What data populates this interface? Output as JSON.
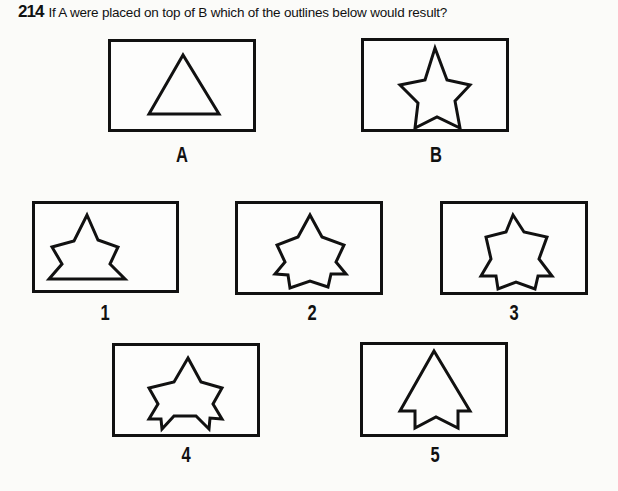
{
  "question": {
    "number": "214",
    "text": "If A were placed on top of B which of the outlines below would result?"
  },
  "given_panels": [
    {
      "label": "A",
      "shape": "triangle"
    },
    {
      "label": "B",
      "shape": "five-point-star"
    }
  ],
  "option_panels": [
    {
      "label": "1",
      "shape": "star-with-flat-base"
    },
    {
      "label": "2",
      "shape": "star-with-notched-base-v1"
    },
    {
      "label": "3",
      "shape": "star-with-notched-base-v2"
    },
    {
      "label": "4",
      "shape": "star-with-small-notches"
    },
    {
      "label": "5",
      "shape": "triangle-with-star-base"
    }
  ]
}
